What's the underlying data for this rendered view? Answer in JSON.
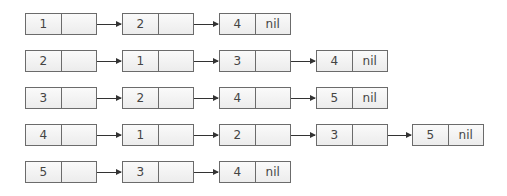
{
  "rows": [
    {
      "nodes": [
        {
          "value": "1",
          "next": ""
        },
        {
          "value": "2",
          "next": ""
        },
        {
          "value": "4",
          "next": "nil"
        }
      ]
    },
    {
      "nodes": [
        {
          "value": "2",
          "next": ""
        },
        {
          "value": "1",
          "next": ""
        },
        {
          "value": "3",
          "next": ""
        },
        {
          "value": "4",
          "next": "nil"
        }
      ]
    },
    {
      "nodes": [
        {
          "value": "3",
          "next": ""
        },
        {
          "value": "2",
          "next": ""
        },
        {
          "value": "4",
          "next": ""
        },
        {
          "value": "5",
          "next": "nil"
        }
      ]
    },
    {
      "nodes": [
        {
          "value": "4",
          "next": ""
        },
        {
          "value": "1",
          "next": ""
        },
        {
          "value": "2",
          "next": ""
        },
        {
          "value": "3",
          "next": ""
        },
        {
          "value": "5",
          "next": "nil"
        }
      ]
    },
    {
      "nodes": [
        {
          "value": "5",
          "next": ""
        },
        {
          "value": "3",
          "next": ""
        },
        {
          "value": "4",
          "next": "nil"
        }
      ]
    }
  ]
}
